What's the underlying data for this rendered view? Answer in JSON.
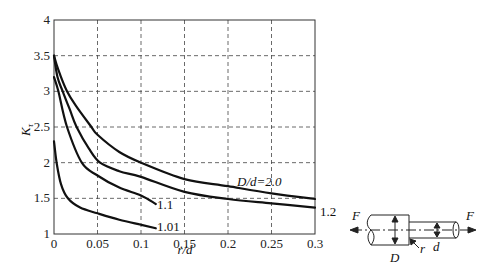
{
  "chart_data": {
    "type": "line",
    "title": "",
    "xlabel": "r/d",
    "ylabel": "K_τ",
    "ylabel_main": "K",
    "ylabel_sub": "τ",
    "xlim": [
      0,
      0.3
    ],
    "ylim": [
      1,
      4
    ],
    "grid": true,
    "x_ticks": [
      "0",
      "0.05",
      "0.1",
      "0.15",
      "0.2",
      "0.25",
      "0.3"
    ],
    "x_tick_values": [
      0,
      0.05,
      0.1,
      0.15,
      0.2,
      0.25,
      0.3
    ],
    "y_ticks": [
      "1",
      "1.5",
      "2",
      "2.5",
      "3",
      "3.5",
      "4"
    ],
    "y_tick_values": [
      1,
      1.5,
      2,
      2.5,
      3,
      3.5,
      4
    ],
    "series": [
      {
        "name": "D/d=2.0",
        "label": "D/d=2.0",
        "x": [
          0,
          0.005,
          0.015,
          0.025,
          0.043,
          0.05,
          0.075,
          0.1,
          0.15,
          0.2,
          0.25,
          0.3
        ],
        "y": [
          3.5,
          3.3,
          3.0,
          2.8,
          2.5,
          2.39,
          2.15,
          2.0,
          1.77,
          1.67,
          1.57,
          1.49
        ]
      },
      {
        "name": "D/d=1.2",
        "label": "1.2",
        "x": [
          0,
          0.004,
          0.01,
          0.018,
          0.026,
          0.04,
          0.053,
          0.075,
          0.1,
          0.15,
          0.2,
          0.25,
          0.3
        ],
        "y": [
          3.5,
          3.2,
          3.0,
          2.75,
          2.5,
          2.2,
          2.0,
          1.88,
          1.8,
          1.59,
          1.49,
          1.43,
          1.37
        ]
      },
      {
        "name": "D/d=1.1",
        "label": "1.1",
        "x": [
          0,
          0.005,
          0.015,
          0.032,
          0.05,
          0.075,
          0.1,
          0.117
        ],
        "y": [
          3.2,
          3.0,
          2.5,
          2.0,
          1.82,
          1.65,
          1.54,
          1.42
        ]
      },
      {
        "name": "D/d=1.01",
        "label": "1.01",
        "x": [
          0,
          0.003,
          0.008,
          0.016,
          0.03,
          0.05,
          0.075,
          0.1,
          0.117
        ],
        "y": [
          2.3,
          2.0,
          1.7,
          1.5,
          1.37,
          1.29,
          1.2,
          1.13,
          1.08
        ]
      }
    ],
    "annotations": [
      "D/d=2.0",
      "1.2",
      "1.1",
      "1.01"
    ]
  },
  "diagram": {
    "force_left": "F",
    "force_right": "F",
    "large_diameter": "D",
    "small_diameter": "d",
    "fillet_radius": "r"
  }
}
